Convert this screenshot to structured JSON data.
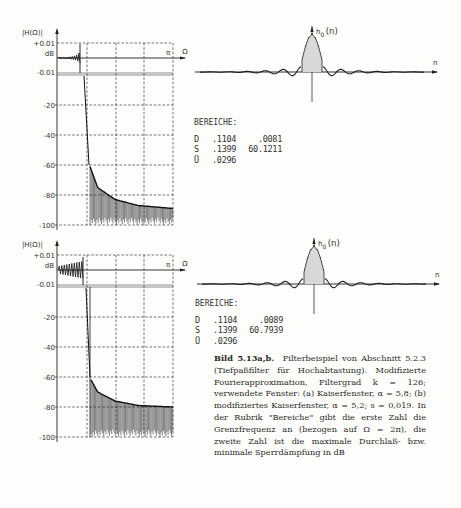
{
  "figure": {
    "label": "Bild 5.13a,b.",
    "caption": "Filterbeispiel von Abschnitt 5.2.3 (Tiefpaßfilter für Hochabtastung). Modifizierte Fourierapproximation, Filtergrad k = 126; verwendete Fenster: (a) Kaiserfenster, α = 5,8; (b) modifiziertes Kaiserfenster, α = 5,2; s = 0,019. In der Rubrik \"Bereiche\" gibt die erste Zahl die Grenzfrequenz an (bezogen auf Ω = 2π), die zweite Zahl ist die maximale Durchlaß- bzw. minimale Sperrdämpfung in dB"
  },
  "panels": [
    {
      "id": "a",
      "magnitude": {
        "ylabel": "|H(Ω)|",
        "unit": "dB",
        "xlabel": "Ω",
        "pi_label": "π",
        "ticks": [
          "+0.01",
          "-0.01",
          "-20",
          "-40",
          "-60",
          "-80",
          "-100"
        ]
      },
      "impulse": {
        "ylabel": "h",
        "ysub": "0",
        "yarg": "(n)",
        "xlabel": "n"
      },
      "bereiche": {
        "title": "BEREICHE:",
        "rows": [
          {
            "k": "D",
            "a": ".1104",
            "b": ".0081"
          },
          {
            "k": "S",
            "a": ".1399",
            "b": "60.1211"
          },
          {
            "k": "Ü",
            "a": ".0296",
            "b": ""
          }
        ]
      }
    },
    {
      "id": "b",
      "magnitude": {
        "ylabel": "|H(Ω)|",
        "unit": "dB",
        "xlabel": "Ω",
        "pi_label": "π",
        "ticks": [
          "+0.01",
          "-0.01",
          "-20",
          "-40",
          "-60",
          "-80",
          "-100"
        ]
      },
      "impulse": {
        "ylabel": "h",
        "ysub": "0",
        "yarg": "(n)",
        "xlabel": "n"
      },
      "bereiche": {
        "title": "BEREICHE:",
        "rows": [
          {
            "k": "D",
            "a": ".1104",
            "b": ".0089"
          },
          {
            "k": "S",
            "a": ".1399",
            "b": "60.7939"
          },
          {
            "k": "Ü",
            "a": ".0296",
            "b": ""
          }
        ]
      }
    }
  ],
  "chart_data": [
    {
      "type": "line",
      "title": "(a) |H(Ω)| in dB, Kaiserfenster α = 5,8",
      "xlabel": "Ω",
      "ylabel": "|H(Ω)| dB",
      "xlim": [
        0,
        3.1416
      ],
      "x_tick_labels": [
        "π"
      ],
      "ylim": [
        -100,
        0.01
      ],
      "y_ticks": [
        0.01,
        0,
        -0.01,
        -20,
        -40,
        -60,
        -80,
        -100
      ],
      "grid": true,
      "passband_ripple_db": 0.0081,
      "stopband_attenuation_db": 60.1211,
      "passband_edge": 0.1104,
      "stopband_edge": 0.1399,
      "transition_width": 0.0296,
      "stopband_envelope": {
        "x_frac": [
          0.28,
          0.35,
          0.5,
          0.7,
          1.0
        ],
        "db": [
          -60,
          -75,
          -83,
          -87,
          -89
        ]
      }
    },
    {
      "type": "stem",
      "title": "(a) h0(n)",
      "xlabel": "n",
      "ylabel": "h0(n)",
      "filter_order": 126,
      "grid": false
    },
    {
      "type": "line",
      "title": "(b) |H(Ω)| in dB, modifiziertes Kaiserfenster α = 5,2; s = 0,019",
      "xlabel": "Ω",
      "ylabel": "|H(Ω)| dB",
      "xlim": [
        0,
        3.1416
      ],
      "x_tick_labels": [
        "π"
      ],
      "ylim": [
        -100,
        0.01
      ],
      "y_ticks": [
        0.01,
        0,
        -0.01,
        -20,
        -40,
        -60,
        -80,
        -100
      ],
      "grid": true,
      "passband_ripple_db": 0.0089,
      "stopband_attenuation_db": 60.7939,
      "passband_edge": 0.1104,
      "stopband_edge": 0.1399,
      "transition_width": 0.0296,
      "stopband_envelope": {
        "x_frac": [
          0.28,
          0.35,
          0.5,
          0.7,
          1.0
        ],
        "db": [
          -60,
          -70,
          -76,
          -79,
          -80
        ]
      }
    },
    {
      "type": "stem",
      "title": "(b) h0(n)",
      "xlabel": "n",
      "ylabel": "h0(n)",
      "filter_order": 126,
      "grid": false
    }
  ]
}
